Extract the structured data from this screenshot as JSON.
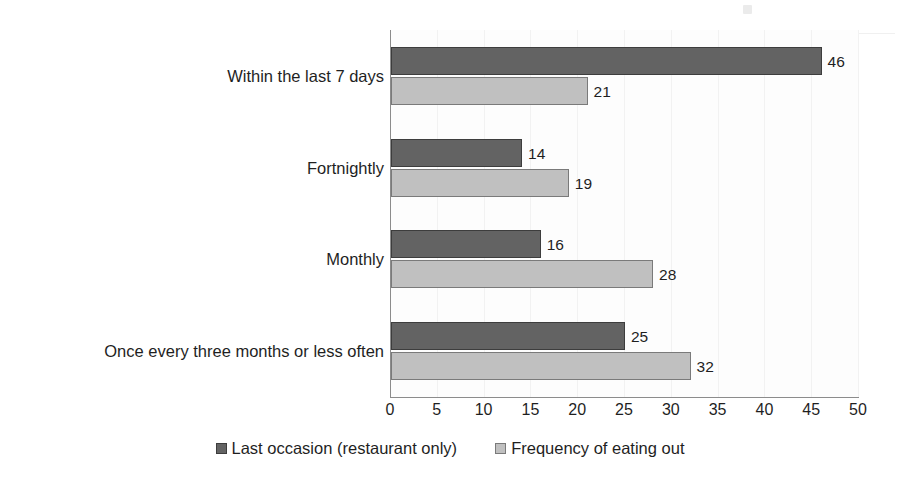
{
  "chart_data": {
    "type": "bar",
    "orientation": "horizontal",
    "title": "",
    "subtitle": "",
    "xlabel": "",
    "ylabel": "",
    "xlim": [
      0,
      50
    ],
    "xticks": [
      0,
      5,
      10,
      15,
      20,
      25,
      30,
      35,
      40,
      45,
      50
    ],
    "xtick_labels": [
      "0",
      "5",
      "10",
      "15",
      "20",
      "25",
      "30",
      "35",
      "40",
      "45",
      "50"
    ],
    "grid": false,
    "legend_position": "bottom",
    "data_labels": true,
    "categories": [
      "Within the last 7 days",
      "Fortnightly",
      "Monthly",
      "Once every three months or less often"
    ],
    "series": [
      {
        "name": "Last occasion (restaurant only)",
        "color": "#636363",
        "values": [
          46,
          14,
          16,
          25
        ],
        "value_labels": [
          "46",
          "14",
          "16",
          "25"
        ]
      },
      {
        "name": "Frequency of eating out",
        "color": "#c0c0c0",
        "values": [
          21,
          19,
          28,
          32
        ],
        "value_labels": [
          "21",
          "19",
          "28",
          "32"
        ]
      }
    ]
  },
  "legend": {
    "items": [
      {
        "label": "Last occasion (restaurant only)",
        "swatch": "dark-gray-square-icon"
      },
      {
        "label": "Frequency of eating out",
        "swatch": "light-gray-square-icon"
      }
    ]
  },
  "colors": {
    "series_dark": "#636363",
    "series_light": "#c0c0c0",
    "axis": "#8c8c8c",
    "text": "#1f1f1f",
    "background": "#ffffff"
  }
}
